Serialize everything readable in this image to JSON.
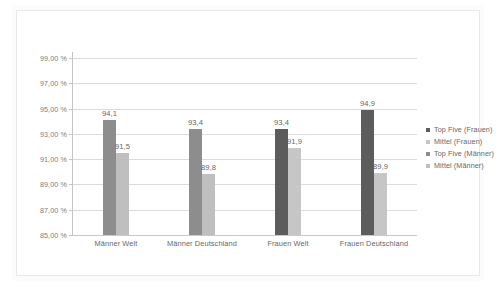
{
  "chart_data": {
    "type": "bar",
    "title": "",
    "subtitle": "",
    "xlabel": "",
    "ylabel": "",
    "grid": true,
    "legend_position": "right",
    "ylim": [
      85,
      99
    ],
    "ytick_labels": [
      "99,00 %",
      "97,00 %",
      "95,00 %",
      "93,00 %",
      "91,00 %",
      "89,00 %",
      "87,00 %",
      "85,00 %"
    ],
    "ytick_values": [
      99,
      97,
      95,
      93,
      91,
      89,
      87,
      85
    ],
    "categories": [
      "Männer Welt",
      "Männer Deutschland",
      "Frauen Welt",
      "Frauen Deutschland"
    ],
    "series": [
      {
        "name": "Top Five (Frauen)",
        "color": "#5c5c5c",
        "values": [
          null,
          null,
          93.4,
          94.9
        ],
        "labels": [
          "",
          "",
          "93,4",
          "94,9"
        ]
      },
      {
        "name": "Mittel (Frauen)",
        "color": "#c6c6c6",
        "values": [
          null,
          null,
          91.9,
          89.9
        ],
        "labels": [
          "",
          "",
          "91,9",
          "89,9"
        ]
      },
      {
        "name": "Top Five (Männer)",
        "color": "#8d8d8d",
        "values": [
          94.1,
          93.4,
          null,
          null
        ],
        "labels": [
          "94,1",
          "93,4",
          "",
          ""
        ]
      },
      {
        "name": "Mittel (Männer)",
        "color": "#bfbfbf",
        "values": [
          91.5,
          89.8,
          null,
          null
        ],
        "labels": [
          "91,5",
          "89,8",
          "",
          ""
        ]
      }
    ],
    "bars": [
      {
        "category": "Männer Welt",
        "series": "Top Five (Männer)",
        "value": 94.1,
        "label": "94,1",
        "color": "#8d8d8d"
      },
      {
        "category": "Männer Welt",
        "series": "Mittel (Männer)",
        "value": 91.5,
        "label": "91,5",
        "color": "#bfbfbf"
      },
      {
        "category": "Männer Deutschland",
        "series": "Top Five (Männer)",
        "value": 93.4,
        "label": "93,4",
        "color": "#8d8d8d"
      },
      {
        "category": "Männer Deutschland",
        "series": "Mittel (Männer)",
        "value": 89.8,
        "label": "89,8",
        "color": "#bfbfbf"
      },
      {
        "category": "Frauen Welt",
        "series": "Top Five (Frauen)",
        "value": 93.4,
        "label": "93,4",
        "color": "#5c5c5c"
      },
      {
        "category": "Frauen Welt",
        "series": "Mittel (Frauen)",
        "value": 91.9,
        "label": "91,9",
        "color": "#c6c6c6"
      },
      {
        "category": "Frauen Deutschland",
        "series": "Top Five (Frauen)",
        "value": 94.9,
        "label": "94,9",
        "color": "#5c5c5c"
      },
      {
        "category": "Frauen Deutschland",
        "series": "Mittel (Frauen)",
        "value": 89.9,
        "label": "89,9",
        "color": "#c6c6c6"
      }
    ]
  },
  "legend": {
    "items": [
      {
        "label": "Top Five (Frauen)",
        "color": "#5c5c5c"
      },
      {
        "label": "Mittel (Frauen)",
        "color": "#c6c6c6"
      },
      {
        "label": "Top Five (Männer)",
        "color": "#8d8d8d"
      },
      {
        "label": "Mittel (Männer)",
        "color": "#bfbfbf"
      }
    ]
  }
}
